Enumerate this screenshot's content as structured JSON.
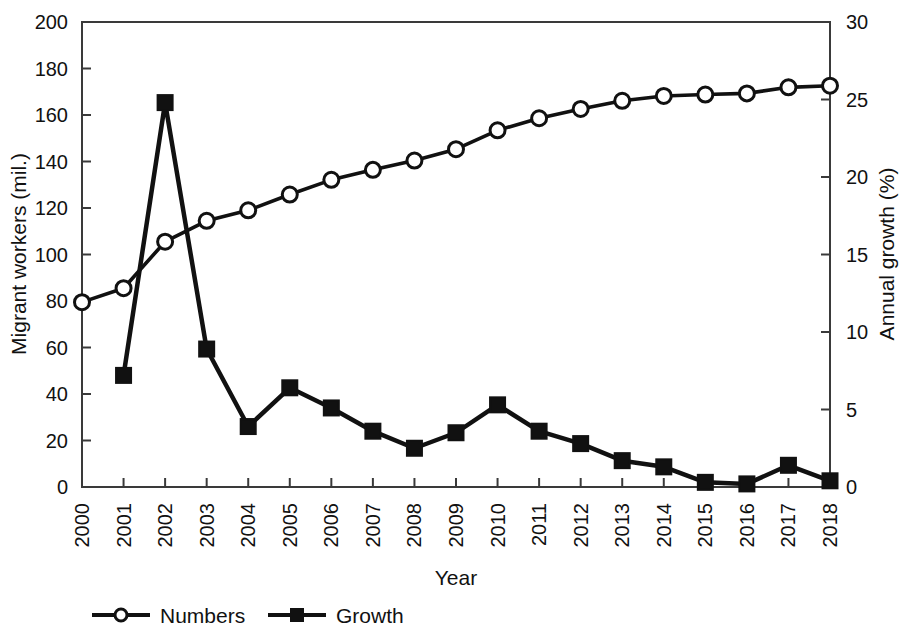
{
  "chart_data": {
    "type": "line",
    "title": "",
    "xlabel": "Year",
    "ylabel": "Migrant workers (mil.)",
    "y2label": "Annual growth (%)",
    "categories": [
      "2000",
      "2001",
      "2002",
      "2003",
      "2004",
      "2005",
      "2006",
      "2007",
      "2008",
      "2009",
      "2010",
      "2011",
      "2012",
      "2013",
      "2014",
      "2015",
      "2016",
      "2017",
      "2018"
    ],
    "ylim": [
      0,
      200
    ],
    "yticks": [
      0,
      20,
      40,
      60,
      80,
      100,
      120,
      140,
      160,
      180,
      200
    ],
    "y2lim": [
      0,
      30
    ],
    "y2ticks": [
      0,
      5,
      10,
      15,
      20,
      25,
      30
    ],
    "grid": false,
    "legend_position": "bottom",
    "series": [
      {
        "name": "Numbers",
        "axis": "left",
        "unit": "mil.",
        "marker": "open-circle",
        "color": "#111111",
        "values": [
          79.5,
          85.5,
          105.5,
          114.5,
          119.0,
          125.8,
          132.1,
          136.4,
          140.4,
          145.3,
          153.4,
          158.6,
          162.6,
          166.1,
          168.2,
          168.8,
          169.3,
          171.9,
          172.6
        ]
      },
      {
        "name": "Growth",
        "axis": "right",
        "unit": "%",
        "marker": "filled-square",
        "color": "#111111",
        "values": [
          null,
          7.2,
          24.8,
          8.9,
          3.9,
          6.4,
          5.1,
          3.6,
          2.5,
          3.5,
          5.3,
          3.6,
          2.8,
          1.7,
          1.3,
          0.3,
          0.2,
          1.4,
          0.4
        ]
      }
    ]
  },
  "legend": {
    "items": [
      {
        "label": "Numbers",
        "marker": "open-circle"
      },
      {
        "label": "Growth",
        "marker": "filled-square"
      }
    ]
  },
  "axes": {
    "left_title": "Migrant workers (mil.)",
    "right_title": "Annual growth (%)",
    "bottom_title": "Year"
  }
}
